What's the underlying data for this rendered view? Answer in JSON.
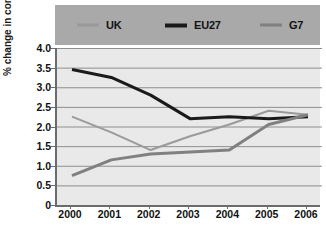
{
  "chart_data": {
    "type": "line",
    "title": "",
    "xlabel": "",
    "ylabel": "% change in consumer prices",
    "categories": [
      "2000",
      "2001",
      "2002",
      "2003",
      "2004",
      "2005",
      "2006"
    ],
    "x": [
      2000,
      2001,
      2002,
      2003,
      2004,
      2005,
      2006
    ],
    "ylim": [
      0,
      4.0
    ],
    "yticks": [
      "0",
      "0.5",
      "1.0",
      "1.5",
      "2.0",
      "2.5",
      "3.0",
      "3.5",
      "4.0"
    ],
    "ytick_values": [
      0,
      0.5,
      1.0,
      1.5,
      2.0,
      2.5,
      3.0,
      3.5,
      4.0
    ],
    "grid": true,
    "grid_axis": "y",
    "legend_position": "top",
    "series": [
      {
        "name": "UK",
        "color": "#9a9a9a",
        "width": 2,
        "values": [
          2.25,
          1.85,
          1.4,
          1.75,
          2.05,
          2.4,
          2.3
        ]
      },
      {
        "name": "EU27",
        "color": "#1a1a1a",
        "width": 3,
        "values": [
          3.45,
          3.25,
          2.8,
          2.2,
          2.25,
          2.2,
          2.25
        ]
      },
      {
        "name": "G7",
        "color": "#808080",
        "width": 3,
        "values": [
          0.75,
          1.15,
          1.3,
          1.35,
          1.4,
          2.05,
          2.3
        ]
      }
    ]
  },
  "legend": {
    "items": [
      {
        "label": "UK"
      },
      {
        "label": "EU27"
      },
      {
        "label": "G7"
      }
    ]
  },
  "colors": {
    "legend_band": "#a9a9a9",
    "plot_background": "#e9e9e9",
    "gridline": "#8e8e8e",
    "axis": "#6b6b6b"
  }
}
